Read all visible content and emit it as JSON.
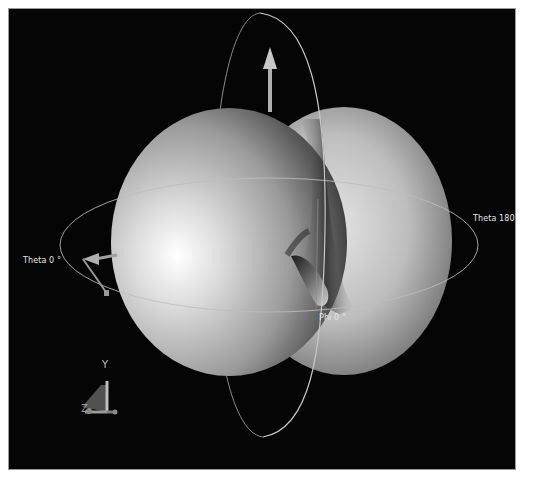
{
  "viewport": {
    "background": "#050505",
    "labels": {
      "theta_0": "Theta 0 °",
      "theta_180": "Theta 180 °",
      "phi_0": "Phi 0 °"
    },
    "axis_triad": {
      "y_label": "Y",
      "z_label": "Z"
    },
    "colors": {
      "surface_light": "#f2f2f2",
      "surface_dark": "#2a2a2a",
      "ring": "#bdbdbd",
      "arrow": "#a8a8a8"
    }
  }
}
